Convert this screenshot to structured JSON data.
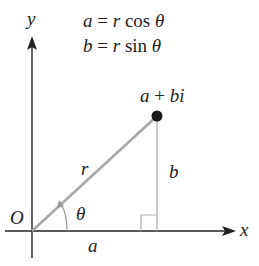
{
  "diagram": {
    "title_equations": {
      "line1": {
        "lhs": "a",
        "eq": "=",
        "rhs_var": "r",
        "func": "cos",
        "angle": "θ"
      },
      "line2": {
        "lhs": "b",
        "eq": "=",
        "rhs_var": "r",
        "func": "sin",
        "angle": "θ"
      }
    },
    "axes": {
      "x_label": "x",
      "y_label": "y",
      "origin_label": "O"
    },
    "point_label": {
      "a": "a",
      "plus": "+",
      "bi": "bi"
    },
    "segment_labels": {
      "hypotenuse": "r",
      "vertical": "b",
      "horizontal": "a",
      "angle": "θ"
    },
    "colors": {
      "axis": "#222222",
      "hypotenuse": "#a8a8a8",
      "vertical": "#b0b0b0",
      "point": "#1a1a1a"
    }
  }
}
